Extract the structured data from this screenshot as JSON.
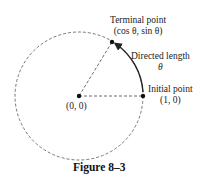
{
  "figure": {
    "caption": "Figure 8–3",
    "labels": {
      "terminal_title": "Terminal point",
      "terminal_coords": "(cos θ, sin θ)",
      "directed_title": "Directed length",
      "directed_symbol": "θ",
      "initial_title": "Initial point",
      "initial_coords": "(1, 0)",
      "origin_coords": "(0, 0)"
    },
    "geometry": {
      "center": [
        79,
        96
      ],
      "radius": 64,
      "terminal_point": [
        112,
        42
      ],
      "initial_point": [
        143,
        96
      ]
    },
    "colors": {
      "line": "#333333",
      "dash": "#555555"
    }
  }
}
